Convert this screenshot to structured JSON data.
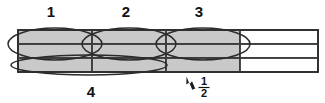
{
  "figure": {
    "background_color": "#ffffff",
    "shaded_color": "#c9c9c9",
    "line_color": "#2b2b2b",
    "empty_color": "#ffffff"
  },
  "labels": {
    "group_1": "1",
    "group_2": "2",
    "group_3": "3",
    "group_4": "4"
  },
  "callout": {
    "numerator": "1",
    "denominator": "2",
    "arrow_icon": "up-left-arrow-icon"
  },
  "bar_model": {
    "rows": 3,
    "columns": 4,
    "shaded_columns": 3,
    "empty_columns": 1,
    "geometry": {
      "left": 18,
      "right": 318,
      "top": 30,
      "bottom": 72,
      "column_edges": [
        18,
        92,
        166,
        240,
        318
      ],
      "row_edges": [
        30,
        44,
        58,
        72
      ]
    },
    "cells": [
      {
        "row": 0,
        "col": 0,
        "state": "shaded"
      },
      {
        "row": 0,
        "col": 1,
        "state": "shaded"
      },
      {
        "row": 0,
        "col": 2,
        "state": "shaded"
      },
      {
        "row": 0,
        "col": 3,
        "state": "empty"
      },
      {
        "row": 1,
        "col": 0,
        "state": "shaded"
      },
      {
        "row": 1,
        "col": 1,
        "state": "shaded"
      },
      {
        "row": 1,
        "col": 2,
        "state": "shaded"
      },
      {
        "row": 1,
        "col": 3,
        "state": "empty"
      },
      {
        "row": 2,
        "col": 0,
        "state": "shaded"
      },
      {
        "row": 2,
        "col": 1,
        "state": "shaded"
      },
      {
        "row": 2,
        "col": 2,
        "state": "shaded"
      },
      {
        "row": 2,
        "col": 3,
        "state": "empty"
      }
    ]
  },
  "loops": [
    {
      "name": "loop-1",
      "label": "1",
      "cx": 55,
      "cy": 44,
      "rx": 47,
      "ry": 16
    },
    {
      "name": "loop-2",
      "label": "2",
      "cx": 129,
      "cy": 44,
      "rx": 47,
      "ry": 16
    },
    {
      "name": "loop-3",
      "label": "3",
      "cx": 203,
      "cy": 44,
      "rx": 47,
      "ry": 16
    },
    {
      "name": "loop-4",
      "label": "4",
      "cx": 89,
      "cy": 65,
      "rx": 78,
      "ry": 10
    }
  ],
  "label_positions": {
    "group_1": {
      "x": 51,
      "y": 17
    },
    "group_2": {
      "x": 126,
      "y": 17
    },
    "group_3": {
      "x": 199,
      "y": 17
    },
    "group_4": {
      "x": 91,
      "y": 96
    }
  }
}
